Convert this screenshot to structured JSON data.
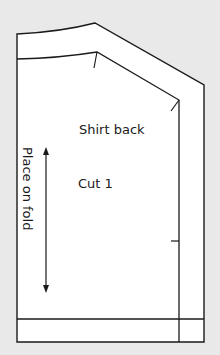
{
  "pattern_piece": {
    "title": "Shirt back",
    "cut_instruction": "Cut 1",
    "fold_instruction": "Place on fold"
  },
  "colors": {
    "background": "#e9e9e9",
    "paper": "#ffffff",
    "line": "#1a1a1a"
  }
}
